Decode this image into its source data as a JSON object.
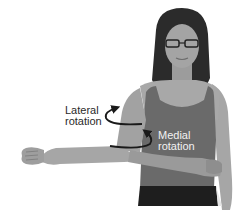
{
  "figure": {
    "labels": {
      "lateral": {
        "line1": "Lateral",
        "line2": "rotation"
      },
      "medial": {
        "line1": "Medial",
        "line2": "rotation"
      }
    },
    "arrows": {
      "lateral": "curved-arrow-up",
      "medial": "curved-arrow-up"
    },
    "colors": {
      "background": "#ffffff",
      "skin": "#a8a8a8",
      "skin_dark": "#8a8a8a",
      "hair": "#2b2b2b",
      "tank_top": "#6a6a6a",
      "shorts": "#1e1e1e",
      "label_dark": "#2a2a2a",
      "label_light": "#f2f2f2",
      "arrow": "#1a1a1a"
    }
  }
}
